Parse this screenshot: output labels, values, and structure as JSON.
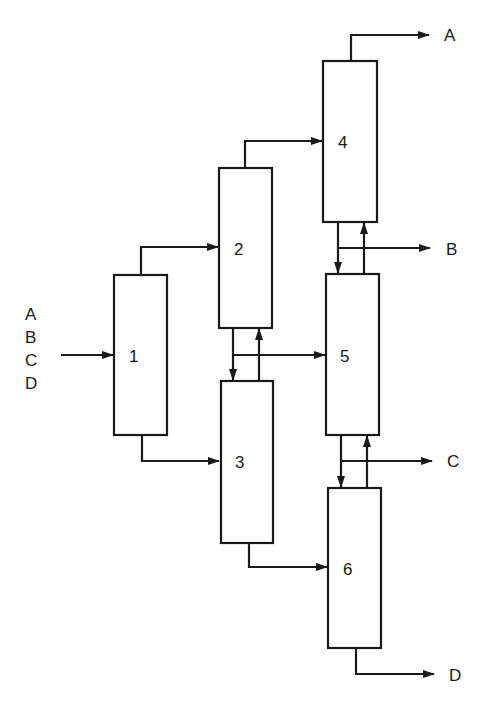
{
  "diagram": {
    "feed": {
      "components": [
        "A",
        "B",
        "C",
        "D"
      ],
      "enters": "1"
    },
    "columns": [
      {
        "id": "1",
        "label": "1"
      },
      {
        "id": "2",
        "label": "2"
      },
      {
        "id": "3",
        "label": "3"
      },
      {
        "id": "4",
        "label": "4"
      },
      {
        "id": "5",
        "label": "5"
      },
      {
        "id": "6",
        "label": "6"
      }
    ],
    "products": [
      {
        "label": "A",
        "from": "4",
        "position": "top"
      },
      {
        "label": "B",
        "from": "4-5 interconnect",
        "position": "side"
      },
      {
        "label": "C",
        "from": "5-6 interconnect",
        "position": "side"
      },
      {
        "label": "D",
        "from": "6",
        "position": "bottom"
      }
    ],
    "connections": [
      {
        "from": "feed",
        "to": "1"
      },
      {
        "from": "1 top",
        "to": "2"
      },
      {
        "from": "1 bottom",
        "to": "3"
      },
      {
        "from": "2 top",
        "to": "4"
      },
      {
        "from": "2 bottom",
        "to": "3",
        "direction": "down"
      },
      {
        "from": "3 top",
        "to": "2",
        "direction": "up"
      },
      {
        "from": "2-3 interconnect",
        "to": "5"
      },
      {
        "from": "3 bottom",
        "to": "6"
      },
      {
        "from": "4 bottom",
        "to": "5",
        "direction": "down"
      },
      {
        "from": "5 top",
        "to": "4",
        "direction": "up"
      },
      {
        "from": "5 bottom",
        "to": "6",
        "direction": "down"
      },
      {
        "from": "6 top",
        "to": "5",
        "direction": "up"
      },
      {
        "from": "4 top",
        "to": "product A"
      },
      {
        "from": "4-5 interconnect",
        "to": "product B"
      },
      {
        "from": "5-6 interconnect",
        "to": "product C"
      },
      {
        "from": "6 bottom",
        "to": "product D"
      }
    ]
  }
}
